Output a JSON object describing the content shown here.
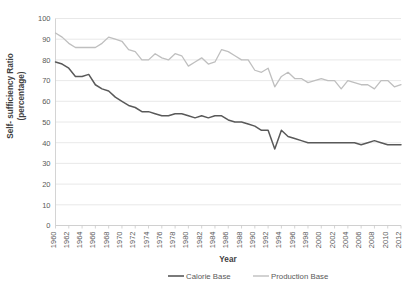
{
  "chart_data": {
    "type": "line",
    "title": "",
    "xlabel": "Year",
    "ylabel": "Self- sufficiency Ratio (percentage)",
    "ylabel_line1": "Self- sufficiency Ratio",
    "ylabel_line2": "(percentage)",
    "ylim": [
      0,
      100
    ],
    "ytick_step": 10,
    "yticks": [
      0,
      10,
      20,
      30,
      40,
      50,
      60,
      70,
      80,
      90,
      100
    ],
    "xlim": [
      1960,
      2012
    ],
    "xtick_step": 2,
    "grid": true,
    "legend_position": "bottom",
    "x": [
      1960,
      1961,
      1962,
      1963,
      1964,
      1965,
      1966,
      1967,
      1968,
      1969,
      1970,
      1971,
      1972,
      1973,
      1974,
      1975,
      1976,
      1977,
      1978,
      1979,
      1980,
      1981,
      1982,
      1983,
      1984,
      1985,
      1986,
      1987,
      1988,
      1989,
      1990,
      1991,
      1992,
      1993,
      1994,
      1995,
      1996,
      1997,
      1998,
      1999,
      2000,
      2001,
      2002,
      2003,
      2004,
      2005,
      2006,
      2007,
      2008,
      2009,
      2010,
      2011,
      2012
    ],
    "xtick_labels": [
      "1960",
      "1962",
      "1964",
      "1966",
      "1968",
      "1970",
      "1972",
      "1974",
      "1976",
      "1978",
      "1980",
      "1982",
      "1984",
      "1986",
      "1988",
      "1990",
      "1992",
      "1994",
      "1996",
      "1998",
      "2000",
      "2002",
      "2004",
      "2006",
      "2008",
      "2010",
      "2012"
    ],
    "series": [
      {
        "name": "Calorie Base",
        "color": "#595959",
        "values": [
          79,
          78,
          76,
          72,
          72,
          73,
          68,
          66,
          65,
          62,
          60,
          58,
          57,
          55,
          55,
          54,
          53,
          53,
          54,
          54,
          53,
          52,
          53,
          52,
          53,
          53,
          51,
          50,
          50,
          49,
          48,
          46,
          46,
          37,
          46,
          43,
          42,
          41,
          40,
          40,
          40,
          40,
          40,
          40,
          40,
          40,
          39,
          40,
          41,
          40,
          39,
          39,
          39
        ]
      },
      {
        "name": "Production Base",
        "color": "#bfbfbf",
        "values": [
          93,
          91,
          88,
          86,
          86,
          86,
          86,
          88,
          91,
          90,
          89,
          85,
          84,
          80,
          80,
          83,
          81,
          80,
          83,
          82,
          77,
          79,
          81,
          78,
          79,
          85,
          84,
          82,
          80,
          80,
          75,
          74,
          76,
          67,
          72,
          74,
          71,
          71,
          69,
          70,
          71,
          70,
          70,
          66,
          70,
          69,
          68,
          68,
          66,
          70,
          70,
          67,
          68
        ]
      }
    ]
  },
  "legend": {
    "items": [
      {
        "label": "Calorie Base",
        "color": "#595959"
      },
      {
        "label": "Production Base",
        "color": "#bfbfbf"
      }
    ]
  }
}
